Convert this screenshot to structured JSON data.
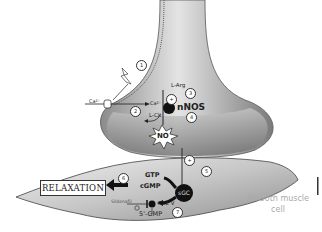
{
  "diagram": {
    "labels": {
      "ca_outside": "Ca²⁺",
      "ca_inside": "Ca²⁺",
      "l_arg": "L-Arg",
      "l_cit": "L-Cit",
      "nnos": "nNOS",
      "no": "NO",
      "gtp": "GTP",
      "cgmp": "cGMP",
      "sgc": "sGC",
      "pde5": "PDE V",
      "sildenafil": "Sildenafil",
      "five_gmp": "5'-GMP",
      "relaxation": "RELAXATION",
      "cell_caption_line1": "Smooth muscle",
      "cell_caption_line2": "cell"
    },
    "steps": [
      "1",
      "2",
      "3",
      "4",
      "5",
      "6",
      "7"
    ],
    "plus_markers": [
      "+",
      "+"
    ],
    "colors": {
      "nerve_gradient_light": "#d8d8d8",
      "nerve_gradient_dark": "#7a7a7a",
      "muscle_gradient_light": "#e8e8e8",
      "muscle_gradient_dark": "#9a9a9a",
      "enzyme_fill": "#111111",
      "caption_text": "#aaaaaa"
    }
  }
}
